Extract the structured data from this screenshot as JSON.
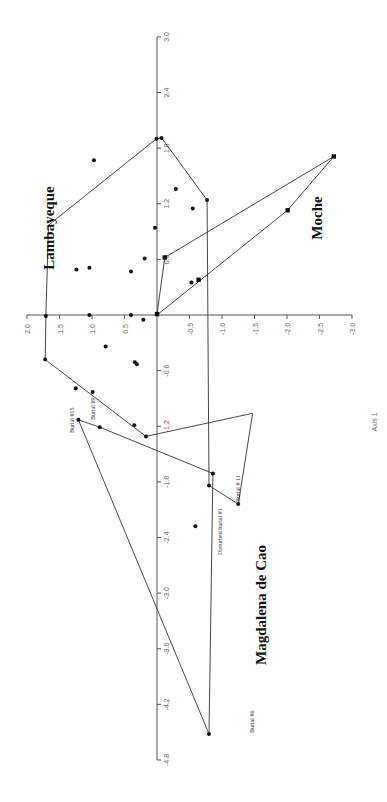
{
  "chart_data": {
    "type": "scatter",
    "orientation": "rotated 90 degrees clockwise (Axis 1 runs vertically, Axis 2 horizontally)",
    "title": "",
    "xlabel": "Axis 1",
    "ylabel": "",
    "axis1": {
      "label": "Axis 1",
      "range": [
        -4.8,
        3.0
      ],
      "ticks": [
        "3.0",
        "2.4",
        "1.8",
        "1.2",
        "0.6",
        "-0.6",
        "-1.2",
        "-1.8",
        "-2.4",
        "-3.0",
        "-3.6",
        "-4.2",
        "-4.8"
      ],
      "tick_values": [
        3.0,
        2.4,
        1.8,
        1.2,
        0.6,
        -0.6,
        -1.2,
        -1.8,
        -2.4,
        -3.0,
        -3.6,
        -4.2,
        -4.8
      ]
    },
    "axis2": {
      "label": "",
      "range": [
        -3.0,
        2.0
      ],
      "ticks": [
        "2.0",
        "1.5",
        "1.0",
        "0.5",
        "-0.5",
        "-1.0",
        "-1.5",
        "-2.0",
        "-2.5",
        "-3.0"
      ],
      "tick_values": [
        2.0,
        1.5,
        1.0,
        0.5,
        -0.5,
        -1.0,
        -1.5,
        -2.0,
        -2.5,
        -3.0
      ]
    },
    "grid": false,
    "legend": "none (groups labeled directly)",
    "groups": [
      {
        "name": "Lambayeque",
        "marker": "circle",
        "hull": [
          [
            -0.01,
            1.71
          ],
          [
            0.97,
            1.67
          ],
          [
            1.9,
            0.01
          ],
          [
            1.91,
            -0.07
          ],
          [
            1.24,
            -0.77
          ],
          [
            -1.84,
            -0.8
          ],
          [
            -2.04,
            -1.25
          ],
          [
            -1.06,
            -1.47
          ],
          [
            -1.31,
            0.17
          ],
          [
            -0.48,
            1.72
          ],
          [
            -0.01,
            1.71
          ]
        ],
        "points": [
          [
            1.9,
            0.01
          ],
          [
            1.91,
            -0.07
          ],
          [
            1.67,
            0.97
          ],
          [
            1.24,
            -0.77
          ],
          [
            1.36,
            -0.29
          ],
          [
            1.15,
            -0.55
          ],
          [
            0.94,
            0.03
          ],
          [
            0.49,
            1.24
          ],
          [
            0.51,
            1.04
          ],
          [
            0.47,
            0.4
          ],
          [
            0.35,
            -0.53
          ],
          [
            0.61,
            0.19
          ],
          [
            0.0,
            1.04
          ],
          [
            0.0,
            0.4
          ],
          [
            -0.01,
            1.71
          ],
          [
            -0.05,
            0.21
          ],
          [
            -0.34,
            0.79
          ],
          [
            -0.48,
            1.72
          ],
          [
            -0.79,
            1.25
          ],
          [
            -0.83,
            0.99
          ],
          [
            -0.51,
            0.34
          ],
          [
            -0.53,
            0.31
          ],
          [
            -1.19,
            0.35
          ],
          [
            -2.04,
            -1.25
          ],
          [
            -1.84,
            -0.8
          ],
          [
            -1.31,
            0.17
          ]
        ]
      },
      {
        "name": "Moche",
        "marker": "square",
        "hull": [
          [
            0.01,
            0.0
          ],
          [
            0.62,
            -0.12
          ],
          [
            1.71,
            -2.72
          ],
          [
            1.13,
            -2.01
          ],
          [
            0.0,
            0.0
          ]
        ],
        "points": [
          [
            0.01,
            0.0
          ],
          [
            0.62,
            -0.12
          ],
          [
            1.71,
            -2.72
          ],
          [
            1.13,
            -2.01
          ],
          [
            0.38,
            -0.64
          ]
        ]
      },
      {
        "name": "Magdalena de Cao",
        "marker": "circle",
        "hull": [
          [
            -1.21,
            0.88
          ],
          [
            -1.13,
            1.21
          ],
          [
            -4.52,
            -0.8
          ],
          [
            -1.71,
            -0.86
          ],
          [
            -1.21,
            0.88
          ]
        ],
        "points": [
          [
            -1.21,
            0.88
          ],
          [
            -1.13,
            1.21
          ],
          [
            -4.52,
            -0.8
          ],
          [
            -1.71,
            -0.86
          ],
          [
            -2.28,
            -0.59
          ]
        ],
        "labeled_points": [
          {
            "label": "Burial #15",
            "axis1": -1.13,
            "axis2": 1.21
          },
          {
            "label": "Burial #9",
            "axis1": -1.21,
            "axis2": 0.88
          },
          {
            "label": "Burial # 11",
            "axis1": -1.71,
            "axis2": -0.86
          },
          {
            "label": "Disturbed burial #1",
            "axis1": -2.28,
            "axis2": -0.59
          },
          {
            "label": "Burial #6",
            "axis1": -4.52,
            "axis2": -0.8
          }
        ]
      }
    ]
  },
  "labels": {
    "lambayeque": "Lambayeque",
    "moche": "Moche",
    "magdalena": "Magdalena de Cao",
    "burial15": "Burial #15",
    "burial9": "Burial #9",
    "burial11": "Burial # 11",
    "disturbed1": "Disturbed burial #1",
    "burial6": "Burial #6",
    "axis1_title": "Axis 1"
  }
}
